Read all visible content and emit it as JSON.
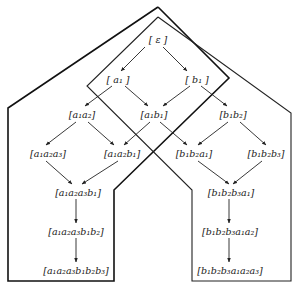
{
  "diagram": {
    "nodes": [
      {
        "id": "eps",
        "label": "[ ε ]",
        "x": 158,
        "y": 40
      },
      {
        "id": "a1",
        "label": "[ a₁ ]",
        "x": 118,
        "y": 80
      },
      {
        "id": "b1",
        "label": "[ b₁ ]",
        "x": 197,
        "y": 80
      },
      {
        "id": "a1a2",
        "label": "[a₁a₂]",
        "x": 82,
        "y": 115
      },
      {
        "id": "a1b1",
        "label": "[a₁b₁]",
        "x": 154,
        "y": 115
      },
      {
        "id": "b1b2",
        "label": "[b₁b₂]",
        "x": 233,
        "y": 115
      },
      {
        "id": "a1a2a3",
        "label": "[a₁a₂a₃]",
        "x": 48,
        "y": 154
      },
      {
        "id": "a1a2b1",
        "label": "[a₁a₂b₁]",
        "x": 122,
        "y": 154
      },
      {
        "id": "b1b2a1",
        "label": "[b₁b₂a₁]",
        "x": 194,
        "y": 154
      },
      {
        "id": "b1b2b3",
        "label": "[b₁b₂b₃]",
        "x": 266,
        "y": 154
      },
      {
        "id": "a1a2a3b1",
        "label": "[a₁a₂a₃b₁]",
        "x": 78,
        "y": 193
      },
      {
        "id": "b1b2b3a1",
        "label": "[b₁b₂b₃a₁]",
        "x": 231,
        "y": 193
      },
      {
        "id": "a1a2a3b1b2",
        "label": "[a₁a₂a₃b₁b₂]",
        "x": 76,
        "y": 232
      },
      {
        "id": "b1b2b3a1a2",
        "label": "[b₁b₂b₃a₁a₂]",
        "x": 230,
        "y": 232
      },
      {
        "id": "a1a2a3b1b2b3",
        "label": "[a₁a₂a₃b₁b₂b₃]",
        "x": 76,
        "y": 271
      },
      {
        "id": "b1b2b3a1a2a3",
        "label": "[b₁b₂b₃a₁a₂a₃]",
        "x": 230,
        "y": 271
      }
    ],
    "edges": [
      {
        "from": "eps",
        "to": "a1",
        "x1": 145,
        "y1": 47,
        "x2": 121,
        "y2": 71
      },
      {
        "from": "eps",
        "to": "b1",
        "x1": 163,
        "y1": 47,
        "x2": 187,
        "y2": 71
      },
      {
        "from": "a1",
        "to": "a1a2",
        "x1": 112,
        "y1": 86,
        "x2": 85,
        "y2": 106
      },
      {
        "from": "a1",
        "to": "a1b1",
        "x1": 125,
        "y1": 86,
        "x2": 148,
        "y2": 106
      },
      {
        "from": "b1",
        "to": "a1b1",
        "x1": 190,
        "y1": 86,
        "x2": 163,
        "y2": 106
      },
      {
        "from": "b1",
        "to": "b1b2",
        "x1": 201,
        "y1": 86,
        "x2": 227,
        "y2": 106
      },
      {
        "from": "a1a2",
        "to": "a1a2a3",
        "x1": 76,
        "y1": 122,
        "x2": 46,
        "y2": 145
      },
      {
        "from": "a1a2",
        "to": "a1a2b1",
        "x1": 88,
        "y1": 122,
        "x2": 114,
        "y2": 145
      },
      {
        "from": "a1b1",
        "to": "a1a2b1",
        "x1": 150,
        "y1": 122,
        "x2": 124,
        "y2": 145
      },
      {
        "from": "a1b1",
        "to": "b1b2a1",
        "x1": 160,
        "y1": 122,
        "x2": 187,
        "y2": 145
      },
      {
        "from": "b1b2",
        "to": "b1b2a1",
        "x1": 228,
        "y1": 122,
        "x2": 198,
        "y2": 145
      },
      {
        "from": "b1b2",
        "to": "b1b2b3",
        "x1": 240,
        "y1": 122,
        "x2": 266,
        "y2": 145
      },
      {
        "from": "a1a2a3",
        "to": "a1a2a3b1",
        "x1": 46,
        "y1": 161,
        "x2": 72,
        "y2": 184
      },
      {
        "from": "a1a2b1",
        "to": "a1a2a3b1",
        "x1": 118,
        "y1": 161,
        "x2": 82,
        "y2": 184
      },
      {
        "from": "b1b2a1",
        "to": "b1b2b3a1",
        "x1": 198,
        "y1": 161,
        "x2": 229,
        "y2": 184
      },
      {
        "from": "b1b2b3",
        "to": "b1b2b3a1",
        "x1": 262,
        "y1": 161,
        "x2": 233,
        "y2": 184
      },
      {
        "from": "a1a2a3b1",
        "to": "a1a2a3b1b2",
        "x1": 76,
        "y1": 199,
        "x2": 76,
        "y2": 223
      },
      {
        "from": "b1b2b3a1",
        "to": "b1b2b3a1a2",
        "x1": 229,
        "y1": 199,
        "x2": 229,
        "y2": 223
      },
      {
        "from": "a1a2a3b1b2",
        "to": "a1a2a3b1b2b3",
        "x1": 76,
        "y1": 238,
        "x2": 76,
        "y2": 262
      },
      {
        "from": "b1b2b3a1a2",
        "to": "b1b2b3a1a2a3",
        "x1": 229,
        "y1": 238,
        "x2": 229,
        "y2": 262
      }
    ],
    "regions": [
      {
        "id": "region-a-first",
        "points": "158,7 229,78 114,190 114,281 8,281 8,108 158,7"
      },
      {
        "id": "region-b-first",
        "points": "158,17 87,86 192,190 192,281 291,281 291,113 158,17"
      }
    ]
  }
}
